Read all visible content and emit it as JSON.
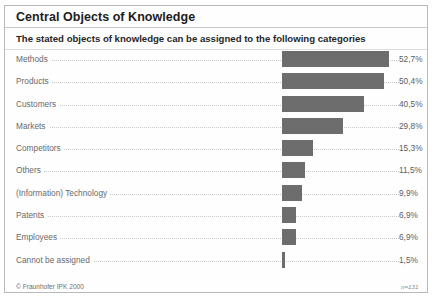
{
  "figure": {
    "title": "Central Objects of Knowledge",
    "subtitle": "The stated objects of knowledge can be assigned to the following categories",
    "copyright": "© Fraunhofer IPK 2000",
    "sample_note": "n=131",
    "bar_color": "#6d6d6d",
    "border_color": "#b9b9b9",
    "label_color": "#6a6a6a"
  },
  "chart_data": {
    "type": "bar",
    "orientation": "horizontal",
    "title": "Central Objects of Knowledge",
    "subtitle": "The stated objects of knowledge can be assigned to the following categories",
    "xlabel": "",
    "ylabel": "",
    "xlim": [
      0,
      55
    ],
    "grid": false,
    "legend": "none",
    "value_suffix": "%",
    "decimal_separator": ",",
    "annotation": "n=131",
    "categories": [
      "Methods",
      "Products",
      "Customers",
      "Markets",
      "Competitors",
      "Others",
      "(Information) Technology",
      "Patents",
      "Employees",
      "Cannot be assigned"
    ],
    "values": [
      52.7,
      50.4,
      40.5,
      29.8,
      15.3,
      11.5,
      9.9,
      6.9,
      6.9,
      1.5
    ],
    "value_labels": [
      "52,7%",
      "50,4%",
      "40,5%",
      "29,8%",
      "15,3%",
      "11,5%",
      "9,9%",
      "6,9%",
      "6,9%",
      "1,5%"
    ]
  }
}
